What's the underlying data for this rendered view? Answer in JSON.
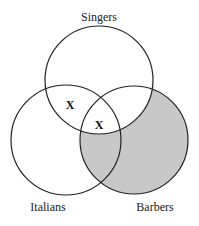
{
  "diagram": {
    "type": "venn-3",
    "sets": [
      {
        "name": "Singers",
        "label": "Singers"
      },
      {
        "name": "Italians",
        "label": "Italians"
      },
      {
        "name": "Barbers",
        "label": "Barbers"
      }
    ],
    "marks": [
      {
        "region": "Singers-Italians-not-Barbers",
        "symbol": "X"
      },
      {
        "region": "Singers-Italians-Barbers",
        "symbol": "X"
      }
    ],
    "shaded_region": "Barbers-not-Singers",
    "colors": {
      "stroke": "#222222",
      "shade": "#c8c8c8",
      "background": "#ffffff"
    }
  }
}
